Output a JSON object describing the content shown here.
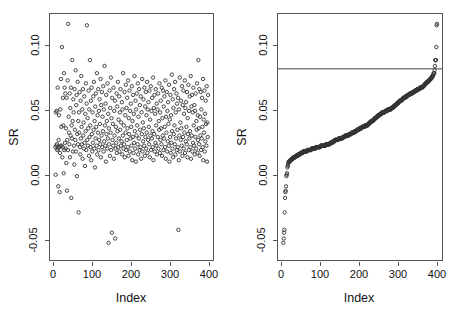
{
  "figure": {
    "background_color": "#ffffff",
    "point_color": "#333333",
    "axis_color": "#555555",
    "refline_color": "#444444"
  },
  "panels": [
    {
      "id": "left",
      "name": "unsorted-scatter",
      "box": {
        "x": 49,
        "y": 13,
        "w": 165,
        "h": 248
      },
      "xlabel": "Index",
      "ylabel": "SR",
      "xticks": [
        0,
        100,
        200,
        300,
        400
      ],
      "xtick_labels": [
        "0",
        "100",
        "200",
        "300",
        "400"
      ],
      "yticks": [
        0.1,
        0.05,
        0.0,
        -0.05
      ],
      "ytick_labels": [
        "0.10",
        "0.05",
        "0.00",
        "-0.05"
      ],
      "xlim": [
        -18,
        478
      ],
      "ylim": [
        -0.058,
        0.113
      ],
      "has_refline": false
    },
    {
      "id": "right",
      "name": "sorted-scatter",
      "box": {
        "x": 277,
        "y": 13,
        "w": 166,
        "h": 248
      },
      "xlabel": "Index",
      "ylabel": "SR",
      "xticks": [
        0,
        100,
        200,
        300,
        400
      ],
      "xtick_labels": [
        "0",
        "100",
        "200",
        "300",
        "400"
      ],
      "yticks": [
        0.1,
        0.05,
        0.0,
        -0.05
      ],
      "ytick_labels": [
        "0.10",
        "0.05",
        "0.00",
        "-0.05"
      ],
      "xlim": [
        -18,
        478
      ],
      "ylim": [
        -0.058,
        0.113
      ],
      "has_refline": true,
      "refline_y": 0.0745
    }
  ],
  "chart_data": {
    "type": "scatter",
    "title": "",
    "xlabel": "Index",
    "ylabel": "SR",
    "xlim": [
      -18,
      478
    ],
    "ylim": [
      -0.058,
      0.113
    ],
    "xticks": [
      0,
      100,
      200,
      300,
      400
    ],
    "yticks": [
      -0.05,
      0.0,
      0.05,
      0.1
    ],
    "grid": false,
    "legend": "none",
    "marker": "open-circle",
    "n_points": 460,
    "panels": [
      "unsorted by index",
      "sorted ascending with reference line"
    ],
    "reference_line": {
      "y": 0.0745,
      "orientation": "horizontal",
      "panel": "right"
    },
    "annotations": [
      "Left panel: SR plotted against observation Index in original order; values scattered mostly between -0.02 and 0.09.",
      "Right panel: same SR values sorted ascending; an S-shaped ordered curve with a horizontal cutoff line at SR = 0.0745 crossed near Index 430.",
      "Right panel lower tail shows isolated low outliers near SR = -0.040 and -0.047.",
      "Right panel upper tail shows a detached cluster of about 4 high outliers near SR = 0.100 to 0.106."
    ],
    "y_unsorted": [
      0.0205,
      0.0015,
      0.0445,
      0.0215,
      0.0455,
      0.0225,
      0.0185,
      0.0615,
      0.0195,
      -0.0065,
      0.0255,
      0.0425,
      0.0205,
      -0.0105,
      0.0165,
      0.0465,
      0.0215,
      0.0675,
      0.0345,
      0.0215,
      0.0895,
      0.0135,
      0.0205,
      0.0545,
      0.0355,
      0.0025,
      0.0715,
      0.0185,
      0.0615,
      0.0235,
      0.0575,
      0.0195,
      0.0335,
      0.0095,
      0.0545,
      -0.0095,
      0.0255,
      0.0665,
      0.0185,
      0.1055,
      0.0415,
      0.0305,
      0.0225,
      0.0575,
      0.0135,
      0.0475,
      0.0285,
      0.0615,
      -0.0145,
      0.0355,
      0.0265,
      0.0805,
      0.0385,
      0.0175,
      0.0535,
      0.0445,
      0.0215,
      0.0085,
      0.0605,
      0.0325,
      0.0255,
      0.0735,
      0.0175,
      0.0495,
      0.0565,
      0.0005,
      0.0295,
      0.0655,
      0.0225,
      0.0385,
      -0.0245,
      0.0445,
      0.0305,
      0.0585,
      0.0205,
      0.0155,
      0.0525,
      0.0265,
      0.0695,
      0.0345,
      0.0225,
      0.0465,
      0.0125,
      0.0605,
      0.0285,
      0.0375,
      0.0195,
      0.0555,
      0.0235,
      0.0075,
      0.0435,
      0.0315,
      0.0645,
      0.0185,
      0.0505,
      0.1045,
      0.0255,
      0.0405,
      0.0215,
      0.0335,
      0.0595,
      0.0145,
      0.0465,
      0.0275,
      0.0805,
      0.0355,
      0.0205,
      0.0525,
      0.0115,
      0.0615,
      0.0295,
      0.0175,
      0.0445,
      0.0235,
      0.0555,
      0.0325,
      0.0655,
      0.0195,
      0.0385,
      0.0065,
      0.0485,
      0.0265,
      0.0575,
      0.0345,
      0.0215,
      0.0715,
      0.0155,
      0.0425,
      0.0305,
      0.0605,
      0.0185,
      0.0455,
      0.0255,
      0.0535,
      0.0365,
      0.0225,
      0.0675,
      0.0135,
      0.0495,
      0.0285,
      0.0585,
      0.0205,
      0.0415,
      0.0315,
      0.0625,
      0.0175,
      0.0465,
      0.0245,
      0.0765,
      0.0355,
      0.0215,
      0.0505,
      0.0105,
      0.0565,
      0.0295,
      0.0385,
      0.0195,
      0.0645,
      0.0265,
      0.0435,
      -0.0455,
      0.0335,
      0.0225,
      0.0595,
      0.0145,
      0.0475,
      0.0305,
      0.0685,
      0.0185,
      0.0405,
      -0.0385,
      0.0545,
      0.0255,
      0.0365,
      0.0215,
      0.0615,
      0.0125,
      0.0455,
      0.0285,
      0.0525,
      -0.0425,
      0.0195,
      0.0345,
      0.0235,
      0.0575,
      0.0165,
      0.0485,
      0.0315,
      0.0655,
      0.0205,
      0.0395,
      0.0265,
      0.0555,
      0.0175,
      0.0445,
      0.0325,
      0.0605,
      0.0215,
      0.0375,
      0.0245,
      0.0515,
      0.0155,
      0.0465,
      0.0285,
      0.0715,
      0.0195,
      0.0355,
      0.0225,
      0.0585,
      0.0135,
      0.0425,
      0.0305,
      0.0635,
      0.0185,
      0.0475,
      0.0255,
      0.0545,
      0.0335,
      0.0205,
      0.0665,
      0.0145,
      0.0405,
      0.0295,
      0.0595,
      0.0175,
      0.0455,
      0.0265,
      0.0505,
      0.0345,
      0.0215,
      0.0625,
      0.0115,
      0.0385,
      0.0275,
      0.0565,
      0.0165,
      0.0435,
      0.0235,
      0.0695,
      0.0315,
      0.0195,
      0.0525,
      0.0105,
      0.0465,
      0.0285,
      0.0575,
      0.0355,
      0.0225,
      0.0645,
      0.0155,
      0.0415,
      0.0265,
      0.0605,
      0.0185,
      0.0495,
      0.0325,
      0.0205,
      0.0555,
      0.0125,
      0.0445,
      0.0295,
      0.0675,
      0.0175,
      0.0375,
      0.0245,
      0.0535,
      0.0335,
      0.0215,
      0.0615,
      0.0145,
      0.0485,
      0.0275,
      0.0585,
      0.0195,
      0.0425,
      0.0305,
      0.0655,
      0.0165,
      0.0465,
      0.0255,
      0.0515,
      0.0345,
      0.0225,
      0.0595,
      0.0135,
      0.0395,
      0.0285,
      0.0625,
      0.0185,
      0.0455,
      0.0265,
      0.0545,
      0.0315,
      0.0205,
      0.0685,
      0.0115,
      0.0475,
      0.0295,
      0.0565,
      0.0175,
      0.0435,
      0.0235,
      0.0605,
      0.0355,
      0.0215,
      0.0505,
      0.0155,
      0.0465,
      0.0275,
      0.0575,
      0.0195,
      0.0385,
      0.0325,
      0.0645,
      0.0165,
      0.0445,
      0.0255,
      0.0525,
      0.0335,
      0.0225,
      0.0615,
      0.0145,
      0.0405,
      0.0285,
      0.0595,
      0.0185,
      0.0485,
      0.0265,
      0.0555,
      0.0345,
      0.0205,
      0.0665,
      0.0125,
      0.0415,
      0.0305,
      0.0585,
      0.0175,
      0.0455,
      0.0245,
      0.0515,
      0.0365,
      0.0215,
      0.0635,
      0.0105,
      0.0395,
      0.0275,
      0.0565,
      0.0165,
      0.0425,
      0.0235,
      0.0705,
      0.0315,
      0.0195,
      0.0535,
      0.0135,
      0.0475,
      0.0295,
      0.0605,
      0.0355,
      0.0225,
      0.0655,
      0.0155,
      0.0445,
      0.0265,
      0.0575,
      0.0185,
      0.0505,
      0.0325,
      0.0205,
      0.0545,
      -0.0365,
      0.0115,
      0.0465,
      0.0285,
      0.0685,
      0.0175,
      0.0375,
      0.0255,
      0.0525,
      0.0335,
      0.0215,
      0.0625,
      0.0145,
      0.0495,
      0.0275,
      0.0595,
      0.0195,
      0.0435,
      0.0305,
      0.0665,
      0.0165,
      0.0475,
      0.0245,
      0.0515,
      0.0345,
      0.0225,
      0.0585,
      0.0135,
      0.0405,
      0.0295,
      0.0635,
      0.0185,
      0.0455,
      0.0265,
      0.0555,
      0.0315,
      0.0205,
      0.0695,
      0.0125,
      0.0485,
      0.0285,
      0.0565,
      0.0175,
      0.0445,
      0.0235,
      0.0615,
      0.0355,
      0.0215,
      0.0495,
      0.0155,
      0.0455,
      0.0275,
      0.0575,
      0.0195,
      0.0385,
      0.0325,
      0.0645,
      0.0165,
      0.0425,
      0.0255,
      0.0805,
      0.0335,
      0.0225,
      0.0605,
      0.0145,
      0.0415,
      0.0285,
      0.0585,
      0.0185,
      0.0465,
      0.0265,
      0.0545,
      0.0345,
      0.0205,
      0.0675,
      0.0115,
      0.0395,
      0.0305,
      0.0595,
      0.0175,
      0.0435,
      0.0245,
      0.0525,
      0.0365,
      0.0215,
      0.0625,
      0.0105,
      0.0375,
      0.0275,
      0.0565
    ]
  },
  "labels": {
    "x_title": "Index",
    "y_title": "SR"
  }
}
